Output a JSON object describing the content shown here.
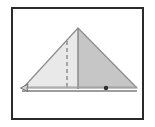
{
  "figure": {
    "frame": {
      "name": "figure-border",
      "x": 11,
      "y": 7,
      "width": 133,
      "height": 113,
      "stroke": "#2b2b2b",
      "stroke_width": 2,
      "background": "#ffffff"
    },
    "canvas_background": "#ffffff"
  },
  "diagram_data": {
    "type": "geometry",
    "shapes": [
      {
        "name": "triangle-outline",
        "kind": "polygon",
        "points": "78,28 23,88 137,88",
        "stroke": "#8c8c8c",
        "stroke_width": 1.2,
        "fill": "none"
      },
      {
        "name": "triangle-left-region",
        "kind": "polygon",
        "points": "78,28 23,88 78,88",
        "fill": "#e8e8e8",
        "stroke": "none",
        "label": "light shaded half"
      },
      {
        "name": "triangle-right-region",
        "kind": "polygon",
        "points": "78,28 78,88 137,88",
        "fill": "#c4c4c4",
        "stroke": "none",
        "label": "dark shaded half"
      },
      {
        "name": "altitude-line",
        "kind": "line",
        "x1": 78,
        "y1": 28,
        "x2": 78,
        "y2": 89,
        "stroke": "#8a8a8a",
        "stroke_width": 1.4,
        "dash": "none",
        "label": "solid altitude from apex"
      },
      {
        "name": "dashed-fold-line",
        "kind": "line",
        "x1": 67,
        "y1": 41,
        "x2": 67,
        "y2": 89,
        "stroke": "#6f6f6f",
        "stroke_width": 1.1,
        "dash": "4,3",
        "label": "dashed vertical fold line"
      },
      {
        "name": "base-double-line-upper",
        "kind": "line",
        "x1": 23,
        "y1": 87,
        "x2": 137,
        "y2": 87,
        "stroke": "#9a9a9a",
        "stroke_width": 1.0
      },
      {
        "name": "base-double-line-lower",
        "kind": "line",
        "x1": 22,
        "y1": 91,
        "x2": 137,
        "y2": 91,
        "stroke": "#7d7d7d",
        "stroke_width": 1.2
      },
      {
        "name": "left-arrow-marker",
        "kind": "arrowhead",
        "tip_x": 21,
        "tip_y": 88,
        "stroke": "#6a6a6a",
        "fill": "#d6d6d6",
        "label": "small arrow at left vertex"
      },
      {
        "name": "base-point-dot",
        "kind": "circle",
        "cx": 106,
        "cy": 88,
        "r": 2.2,
        "fill": "#2e2e2e",
        "label": "marked point on base"
      }
    ],
    "vertices": [
      {
        "name": "apex-vertex",
        "x": 78,
        "y": 28
      },
      {
        "name": "left-base-vertex",
        "x": 23,
        "y": 88
      },
      {
        "name": "right-base-vertex",
        "x": 137,
        "y": 88
      }
    ],
    "labels": [],
    "annotations": []
  }
}
